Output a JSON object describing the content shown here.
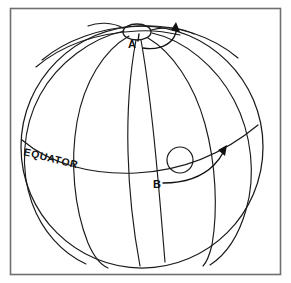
{
  "figure": {
    "background_color": "#ffffff",
    "ink_color": "#1a1a1a",
    "frame_color": "#6f6f6f",
    "labels": {
      "equator": "EQUATOR",
      "point_a": "A",
      "point_b": "B"
    },
    "globe": {
      "center_x": 142,
      "center_y": 147,
      "radius": 121
    },
    "polar_cap": {
      "center_x": 137,
      "center_y": 32,
      "rx": 14,
      "ry": 8
    },
    "spot_b": {
      "center_x": 180,
      "center_y": 160,
      "radius": 13
    },
    "frame": {
      "x": 10,
      "y": 8,
      "width": 271,
      "height": 267
    },
    "meridian_count": 6,
    "arrows": [
      {
        "name": "arrow-a",
        "label": "A",
        "direction": "up-right"
      },
      {
        "name": "arrow-b",
        "label": "B",
        "direction": "up-right"
      }
    ]
  }
}
